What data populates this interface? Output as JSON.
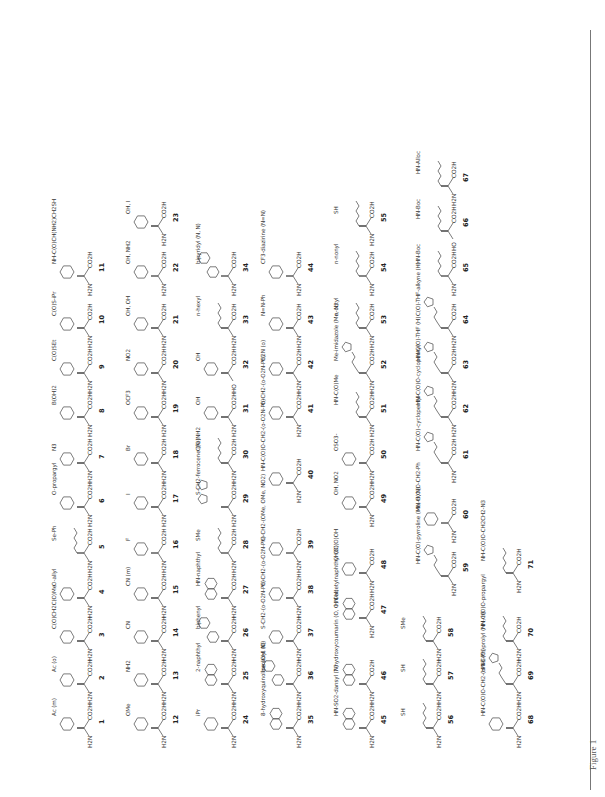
{
  "figure": {
    "caption": "Figure 1",
    "rule_color": "#777777"
  },
  "compounds": [
    {
      "id": "1",
      "n_term": "H2N",
      "c_term": "CO2H",
      "substituent": "Ac (m)",
      "ring": "benzene",
      "x": 91,
      "y": 742
    },
    {
      "id": "2",
      "n_term": "H2N",
      "c_term": "CO2H",
      "substituent": "Ac (o)",
      "ring": "benzene",
      "x": 91,
      "y": 698
    },
    {
      "id": "3",
      "n_term": "H2N",
      "c_term": "CO2H",
      "substituent": "C(O)CH2C(O)Me",
      "ring": "benzene",
      "x": 91,
      "y": 655
    },
    {
      "id": "4",
      "n_term": "H2N",
      "c_term": "CO2H",
      "substituent": "O-allyl",
      "ring": "benzene",
      "x": 91,
      "y": 612
    },
    {
      "id": "5",
      "n_term": "H2N",
      "c_term": "CO2H",
      "substituent": "Se-Ph",
      "ring": "none",
      "x": 91,
      "y": 567
    },
    {
      "id": "6",
      "n_term": "H2N",
      "c_term": "CO2H",
      "substituent": "O-propargyl",
      "ring": "benzene",
      "x": 91,
      "y": 521
    },
    {
      "id": "7",
      "n_term": "H2N",
      "c_term": "CO2H",
      "substituent": "N3",
      "ring": "benzene",
      "x": 91,
      "y": 477
    },
    {
      "id": "8",
      "n_term": "H2N",
      "c_term": "CO2H",
      "substituent": "B(OH)2",
      "ring": "benzene",
      "x": 91,
      "y": 431
    },
    {
      "id": "9",
      "n_term": "H2N",
      "c_term": "CO2H",
      "substituent": "C(O)SEt",
      "ring": "benzene",
      "x": 91,
      "y": 387
    },
    {
      "id": "10",
      "n_term": "H2N",
      "c_term": "CO2H",
      "substituent": "C(O)S-iPr",
      "ring": "benzene",
      "x": 91,
      "y": 342
    },
    {
      "id": "11",
      "n_term": "H2N",
      "c_term": "CO2H",
      "substituent": "NH-C(O)CH(NH2)CH2SH",
      "ring": "benzene",
      "x": 91,
      "y": 290
    },
    {
      "id": "12",
      "n_term": "H2N",
      "c_term": "CO2H",
      "substituent": "OMe",
      "ring": "benzene",
      "x": 165,
      "y": 742
    },
    {
      "id": "13",
      "n_term": "H2N",
      "c_term": "CO2H",
      "substituent": "NH2",
      "ring": "benzene",
      "x": 165,
      "y": 698
    },
    {
      "id": "14",
      "n_term": "H2N",
      "c_term": "CO2H",
      "substituent": "CN",
      "ring": "benzene",
      "x": 165,
      "y": 655
    },
    {
      "id": "15",
      "n_term": "H2N",
      "c_term": "CO2H",
      "substituent": "CN (m)",
      "ring": "benzene",
      "x": 165,
      "y": 612
    },
    {
      "id": "16",
      "n_term": "H2N",
      "c_term": "CO2H",
      "substituent": "F",
      "ring": "benzene",
      "x": 165,
      "y": 567
    },
    {
      "id": "17",
      "n_term": "H2N",
      "c_term": "CO2H",
      "substituent": "I",
      "ring": "benzene",
      "x": 165,
      "y": 521
    },
    {
      "id": "18",
      "n_term": "H2N",
      "c_term": "CO2H",
      "substituent": "Br",
      "ring": "benzene",
      "x": 165,
      "y": 477
    },
    {
      "id": "19",
      "n_term": "H2N",
      "c_term": "CO2H",
      "substituent": "OCF3",
      "ring": "benzene",
      "x": 165,
      "y": 431
    },
    {
      "id": "20",
      "n_term": "H2N",
      "c_term": "CO2H",
      "substituent": "NO2",
      "ring": "benzene",
      "x": 165,
      "y": 387
    },
    {
      "id": "21",
      "n_term": "H2N",
      "c_term": "CO2H",
      "substituent": "OH, OH",
      "ring": "benzene",
      "x": 165,
      "y": 342
    },
    {
      "id": "22",
      "n_term": "H2N",
      "c_term": "CO2H",
      "substituent": "OH, NH2",
      "ring": "benzene",
      "x": 165,
      "y": 290
    },
    {
      "id": "23",
      "n_term": "H2N",
      "c_term": "CO2H",
      "substituent": "OH, I",
      "ring": "benzene",
      "x": 165,
      "y": 240
    },
    {
      "id": "24",
      "n_term": "H2N",
      "c_term": "CO2H",
      "substituent": "iPr",
      "ring": "benzene",
      "x": 235,
      "y": 742
    },
    {
      "id": "25",
      "n_term": "H2N",
      "c_term": "CO2H",
      "substituent": "2-naphthyl",
      "ring": "naphthalene",
      "x": 235,
      "y": 698
    },
    {
      "id": "26",
      "n_term": "H2N",
      "c_term": "CO2H",
      "substituent": "biphenyl",
      "ring": "biphenyl",
      "x": 235,
      "y": 655
    },
    {
      "id": "27",
      "n_term": "H2N",
      "c_term": "CO2H",
      "substituent": "HN-naphthyl",
      "ring": "naphthalene",
      "x": 235,
      "y": 612
    },
    {
      "id": "28",
      "n_term": "H2N",
      "c_term": "CO2H",
      "substituent": "SMe",
      "ring": "none",
      "x": 235,
      "y": 567
    },
    {
      "id": "29",
      "n_term": "H2N",
      "c_term": "CO2H",
      "substituent": "S-CH2-ferrocene (Fe)",
      "ring": "ferrocene",
      "x": 235,
      "y": 521
    },
    {
      "id": "30",
      "n_term": "H2N",
      "c_term": "CO2H",
      "substituent": "C(O)NH2",
      "ring": "none",
      "x": 235,
      "y": 477
    },
    {
      "id": "31",
      "n_term": "H2N",
      "c_term": "CO2H",
      "substituent": "OH",
      "ring": "benzene",
      "x": 235,
      "y": 431
    },
    {
      "id": "32",
      "n_term": "HO",
      "c_term": "CO2H",
      "substituent": "OH",
      "ring": "benzene",
      "x": 235,
      "y": 387
    },
    {
      "id": "33",
      "n_term": "H2N",
      "c_term": "CO2H",
      "substituent": "n-hexyl",
      "ring": "none",
      "x": 235,
      "y": 342
    },
    {
      "id": "34",
      "n_term": "H2N",
      "c_term": "CO2H",
      "substituent": "bipyridyl (N, N)",
      "ring": "bipyridine",
      "x": 235,
      "y": 290
    },
    {
      "id": "35",
      "n_term": "H2N",
      "c_term": "CO2H",
      "substituent": "8-hydroxyquinoline (OH, N)",
      "ring": "quinoline",
      "x": 300,
      "y": 742
    },
    {
      "id": "36",
      "n_term": "H2N",
      "c_term": "CO2H",
      "substituent": "benzoyl (O)",
      "ring": "benzophenone",
      "x": 300,
      "y": 698
    },
    {
      "id": "37",
      "n_term": "H2N",
      "c_term": "CO2H",
      "substituent": "S-CH2-(o-O2N-Ph)",
      "ring": "benzene",
      "x": 300,
      "y": 655
    },
    {
      "id": "38",
      "n_term": "H2N",
      "c_term": "CO2H",
      "substituent": "O-CH2-(o-O2N-Ph)",
      "ring": "benzene",
      "x": 300,
      "y": 612
    },
    {
      "id": "39",
      "n_term": "H2N",
      "c_term": "CO2H",
      "substituent": "O-CH2-(OMe, OMe, NO2)",
      "ring": "benzene",
      "x": 300,
      "y": 567
    },
    {
      "id": "40",
      "n_term": "H2N",
      "c_term": "CO2H",
      "substituent": "HN-C(O)O-CH2-(o-O2N-Ph)",
      "ring": "benzene",
      "x": 300,
      "y": 497
    },
    {
      "id": "41",
      "n_term": "H2N",
      "c_term": "CO2H",
      "substituent": "O-CH2-(o-O2N-Ph)",
      "ring": "benzene",
      "x": 300,
      "y": 431
    },
    {
      "id": "42",
      "n_term": "H2N",
      "c_term": "CO2H",
      "substituent": "O2N (o)",
      "ring": "benzene",
      "x": 300,
      "y": 387
    },
    {
      "id": "43",
      "n_term": "H2N",
      "c_term": "CO2H",
      "substituent": "N=N-Ph",
      "ring": "benzene",
      "x": 300,
      "y": 342
    },
    {
      "id": "44",
      "n_term": "H2N",
      "c_term": "CO2H",
      "substituent": "CF3-diazirine (N=N)",
      "ring": "benzene",
      "x": 300,
      "y": 290
    },
    {
      "id": "45",
      "n_term": "H2N",
      "c_term": "CO2H",
      "substituent": "HN-SO2-dansyl (N)",
      "ring": "naphthalene",
      "x": 373,
      "y": 742
    },
    {
      "id": "46",
      "n_term": "H2N",
      "c_term": "CO2H",
      "substituent": "7-hydroxycoumarin (O, O, OH)",
      "ring": "coumarin",
      "x": 373,
      "y": 698
    },
    {
      "id": "47",
      "n_term": "H2N",
      "c_term": "CO2H",
      "substituent": "HN-acetylnaphthyl (O)",
      "ring": "naphthalene",
      "x": 373,
      "y": 632
    },
    {
      "id": "48",
      "n_term": "H2N",
      "c_term": "CO2H",
      "substituent": "CH2C(O)OH",
      "ring": "benzene",
      "x": 373,
      "y": 587
    },
    {
      "id": "49",
      "n_term": "H2N",
      "c_term": "CO2H",
      "substituent": "OH, NO2",
      "ring": "benzene",
      "x": 373,
      "y": 521
    },
    {
      "id": "50",
      "n_term": "H2N",
      "c_term": "CO2H",
      "substituent": "OSO3-",
      "ring": "benzene",
      "x": 373,
      "y": 477
    },
    {
      "id": "51",
      "n_term": "H2N",
      "c_term": "CO2H",
      "substituent": "HN-C(O)Me",
      "ring": "none",
      "x": 373,
      "y": 431
    },
    {
      "id": "52",
      "n_term": "H2N",
      "c_term": "CO2H",
      "substituent": "Me-imidazole (Me, N)",
      "ring": "imidazole",
      "x": 373,
      "y": 387
    },
    {
      "id": "53",
      "n_term": "H2N",
      "c_term": "CO2H",
      "substituent": "n-octyl",
      "ring": "none",
      "x": 373,
      "y": 342
    },
    {
      "id": "54",
      "n_term": "H2N",
      "c_term": "CO2H",
      "substituent": "n-nonyl",
      "ring": "none",
      "x": 373,
      "y": 290
    },
    {
      "id": "55",
      "n_term": "H2N",
      "c_term": "CO2H",
      "substituent": "SH",
      "ring": "none",
      "x": 373,
      "y": 240
    },
    {
      "id": "56",
      "n_term": "H2N",
      "c_term": "CO2H",
      "substituent": "SH",
      "ring": "none",
      "x": 440,
      "y": 742
    },
    {
      "id": "57",
      "n_term": "H2N",
      "c_term": "CO2H",
      "substituent": "SH",
      "ring": "none",
      "x": 440,
      "y": 698
    },
    {
      "id": "58",
      "n_term": "H2N",
      "c_term": "CO2H",
      "substituent": "SMe",
      "ring": "none",
      "x": 440,
      "y": 655
    },
    {
      "id": "59",
      "n_term": "H2N",
      "c_term": "CO2H",
      "substituent": "HN-C(O)-pyrroline (Me, H, N)",
      "ring": "pyrroline",
      "x": 455,
      "y": 590
    },
    {
      "id": "60",
      "n_term": "H2N",
      "c_term": "CO2H",
      "substituent": "HN-C(O)O-CH2-Ph",
      "ring": "benzene",
      "x": 455,
      "y": 537
    },
    {
      "id": "61",
      "n_term": "H2N",
      "c_term": "CO2H",
      "substituent": "HN-C(O)-cyclopentyl",
      "ring": "cyclopentane",
      "x": 455,
      "y": 477
    },
    {
      "id": "62",
      "n_term": "H2N",
      "c_term": "CO2H",
      "substituent": "HN-C(O)O-cyclopentyl",
      "ring": "cyclopentane",
      "x": 455,
      "y": 431
    },
    {
      "id": "63",
      "n_term": "H2N",
      "c_term": "CO2H",
      "substituent": "HN-C(O)-THF (H)",
      "ring": "tetrahydrofuran",
      "x": 455,
      "y": 387
    },
    {
      "id": "64",
      "n_term": "H2N",
      "c_term": "CO2H",
      "substituent": "C(O)-THF-alkyne (H)",
      "ring": "tetrahydrofuran",
      "x": 455,
      "y": 342
    },
    {
      "id": "65",
      "n_term": "H2N",
      "c_term": "CO2H",
      "substituent": "HN-Boc",
      "ring": "none",
      "x": 455,
      "y": 290
    },
    {
      "id": "66",
      "n_term": "HO",
      "c_term": "CO2H",
      "substituent": "HN-Boc",
      "ring": "none",
      "x": 455,
      "y": 245
    },
    {
      "id": "67",
      "n_term": "H2N",
      "c_term": "CO2H",
      "substituent": "HN-Alloc",
      "ring": "none",
      "x": 455,
      "y": 200
    },
    {
      "id": "68",
      "n_term": "H2N",
      "c_term": "CO2H",
      "substituent": "HN-C(O)O-CH2-(o-N3-Ph)",
      "ring": "benzene",
      "x": 520,
      "y": 742
    },
    {
      "id": "69",
      "n_term": "H2N",
      "c_term": "CO2H",
      "substituent": "HN-C(O)-prolyl (NH, H)",
      "ring": "pyrrolidine",
      "x": 520,
      "y": 698
    },
    {
      "id": "70",
      "n_term": "H2N",
      "c_term": "CO2H",
      "substituent": "HN-C(O)O-propargyl",
      "ring": "none",
      "x": 520,
      "y": 655
    },
    {
      "id": "71",
      "n_term": "H2N",
      "c_term": "CO2H",
      "substituent": "NH-C(O)O-CH2CH2-N3",
      "ring": "none",
      "x": 520,
      "y": 587
    }
  ]
}
